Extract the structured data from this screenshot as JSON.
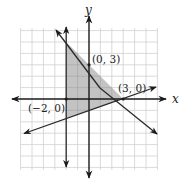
{
  "diagram": {
    "type": "linear-inequality-system-graph",
    "axes": {
      "x_label": "x",
      "y_label": "y"
    },
    "grid": {
      "x_min": -6,
      "x_max": 6,
      "y_min": -6,
      "y_max": 6,
      "step": 1
    },
    "lines": [
      {
        "name": "vertical-line",
        "equation": "x = -2"
      },
      {
        "name": "decreasing-line",
        "equation": "x + y = 3",
        "through": [
          "(0, 3)",
          "(3, 0)"
        ]
      },
      {
        "name": "increasing-line",
        "equation": "y = (1/3)x - 1",
        "through": [
          "(3, 0)"
        ]
      }
    ],
    "shaded_region": {
      "vertices": [
        [
          -2,
          5
        ],
        [
          3,
          0
        ],
        [
          -2,
          -1.667
        ]
      ],
      "color": "#b8b8b8"
    },
    "points": [
      {
        "label": "(0, 3)",
        "x": 0,
        "y": 3
      },
      {
        "label": "(3, 0)",
        "x": 3,
        "y": 0
      },
      {
        "label": "(−2, 0)",
        "x": -2,
        "y": 0
      }
    ],
    "colors": {
      "grid": "#d0d0d0",
      "axis": "#1a1a1a",
      "line": "#2a2a2a",
      "shade": "#b8b8b8"
    }
  }
}
